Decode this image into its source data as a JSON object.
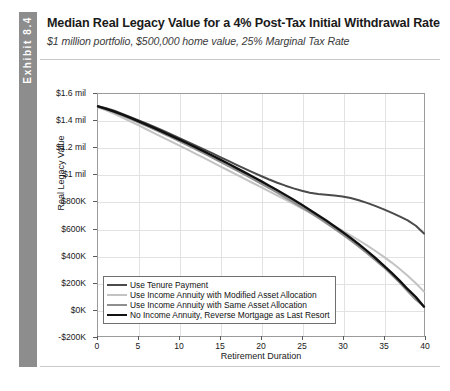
{
  "exhibit": {
    "tab_label": "Exhibit 8.4"
  },
  "header": {
    "title": "Median Real Legacy Value for a 4% Post-Tax Initial Withdrawal Rate",
    "subtitle": "$1 million portfolio, $500,000 home value, 25% Marginal Tax Rate"
  },
  "chart_data": {
    "type": "line",
    "title": "Median Real Legacy Value for a 4% Post-Tax Initial Withdrawal Rate",
    "subtitle": "$1 million portfolio, $500,000 home value, 25% Marginal Tax Rate",
    "xlabel": "Retirement Duration",
    "ylabel": "Real Legacy Value",
    "xlim": [
      0,
      40
    ],
    "ylim": [
      -200000,
      1600000
    ],
    "xticks": [
      0,
      5,
      10,
      15,
      20,
      25,
      30,
      35,
      40
    ],
    "xticklabels": [
      "0",
      "5",
      "10",
      "15",
      "20",
      "25",
      "30",
      "35",
      "40"
    ],
    "yticks": [
      1600000,
      1400000,
      1200000,
      1000000,
      800000,
      600000,
      400000,
      200000,
      0,
      -200000
    ],
    "yticklabels": [
      "$1.6 mil",
      "$1.4 mil",
      "$1.2 mil",
      "$1 mil",
      "$800K",
      "$600K",
      "$400K",
      "$200K",
      "$0K",
      "-$200K"
    ],
    "grid": true,
    "legend_position": "lower left",
    "x": [
      0,
      1,
      2,
      3,
      4,
      5,
      6,
      7,
      8,
      9,
      10,
      11,
      12,
      13,
      14,
      15,
      16,
      17,
      18,
      19,
      20,
      21,
      22,
      23,
      24,
      25,
      26,
      27,
      28,
      29,
      30,
      31,
      32,
      33,
      34,
      35,
      36,
      37,
      38,
      39,
      40
    ],
    "series": [
      {
        "name": "Use Tenure Payment",
        "color": "#4a4a4a",
        "width": 2.0,
        "values": [
          1510000,
          1495000,
          1475000,
          1452000,
          1428000,
          1404000,
          1379000,
          1353000,
          1327000,
          1300000,
          1272000,
          1244000,
          1216000,
          1188000,
          1160000,
          1131000,
          1102000,
          1073000,
          1045000,
          1017000,
          990000,
          964000,
          940000,
          918000,
          898000,
          880000,
          866000,
          856000,
          850000,
          845000,
          838000,
          826000,
          810000,
          790000,
          768000,
          744000,
          718000,
          690000,
          660000,
          620000,
          562000
        ]
      },
      {
        "name": "Use Income Annuity with Modified Asset Allocation",
        "color": "#c3c3c3",
        "width": 2.0,
        "values": [
          1500000,
          1478000,
          1452000,
          1424000,
          1395000,
          1366000,
          1336000,
          1306000,
          1276000,
          1246000,
          1216000,
          1186000,
          1155000,
          1124000,
          1093000,
          1062000,
          1031000,
          1000000,
          969000,
          938000,
          907000,
          876000,
          845000,
          814000,
          782000,
          750000,
          718000,
          685000,
          652000,
          618000,
          583000,
          548000,
          512000,
          474000,
          434000,
          392000,
          348000,
          300000,
          248000,
          192000,
          130000
        ]
      },
      {
        "name": "Use Income Annuity with Same Asset Allocation",
        "color": "#8f8f8f",
        "width": 2.0,
        "values": [
          1505000,
          1486000,
          1464000,
          1440000,
          1414000,
          1388000,
          1361000,
          1333000,
          1305000,
          1277000,
          1248000,
          1218000,
          1188000,
          1158000,
          1127000,
          1096000,
          1064000,
          1032000,
          1000000,
          967000,
          934000,
          900000,
          866000,
          830000,
          794000,
          757000,
          719000,
          680000,
          640000,
          598000,
          555000,
          510000,
          464000,
          416000,
          366000,
          314000,
          258000,
          198000,
          132000,
          70000,
          20000
        ]
      },
      {
        "name": "No Income Annuity, Reverse Mortgage as Last Resort",
        "color": "#111111",
        "width": 2.4,
        "values": [
          1508000,
          1490000,
          1469000,
          1446000,
          1422000,
          1397000,
          1371000,
          1344000,
          1317000,
          1289000,
          1261000,
          1232000,
          1203000,
          1173000,
          1143000,
          1112000,
          1081000,
          1049000,
          1017000,
          985000,
          952000,
          918000,
          884000,
          849000,
          813000,
          776000,
          738000,
          699000,
          659000,
          617000,
          574000,
          529000,
          482000,
          433000,
          382000,
          328000,
          272000,
          212000,
          148000,
          90000,
          18000
        ]
      }
    ]
  }
}
